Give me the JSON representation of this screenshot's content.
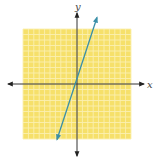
{
  "chart_data": {
    "type": "line",
    "title": "",
    "xlabel": "x",
    "ylabel": "y",
    "xlim": [
      -10,
      10
    ],
    "ylim": [
      -10,
      10
    ],
    "grid": true,
    "grid_step": 1,
    "series": [
      {
        "name": "line",
        "equation": "y = 3x + 1",
        "slope": 3,
        "intercept": 1,
        "x": [
          -3.7,
          3.7
        ],
        "y": [
          -10.1,
          12.1
        ],
        "arrows": "both"
      }
    ],
    "colors": {
      "grid_background": "#f6e06a",
      "grid_lines": "#fbefb0",
      "axes": "#333333",
      "line": "#3a8fa8"
    }
  }
}
